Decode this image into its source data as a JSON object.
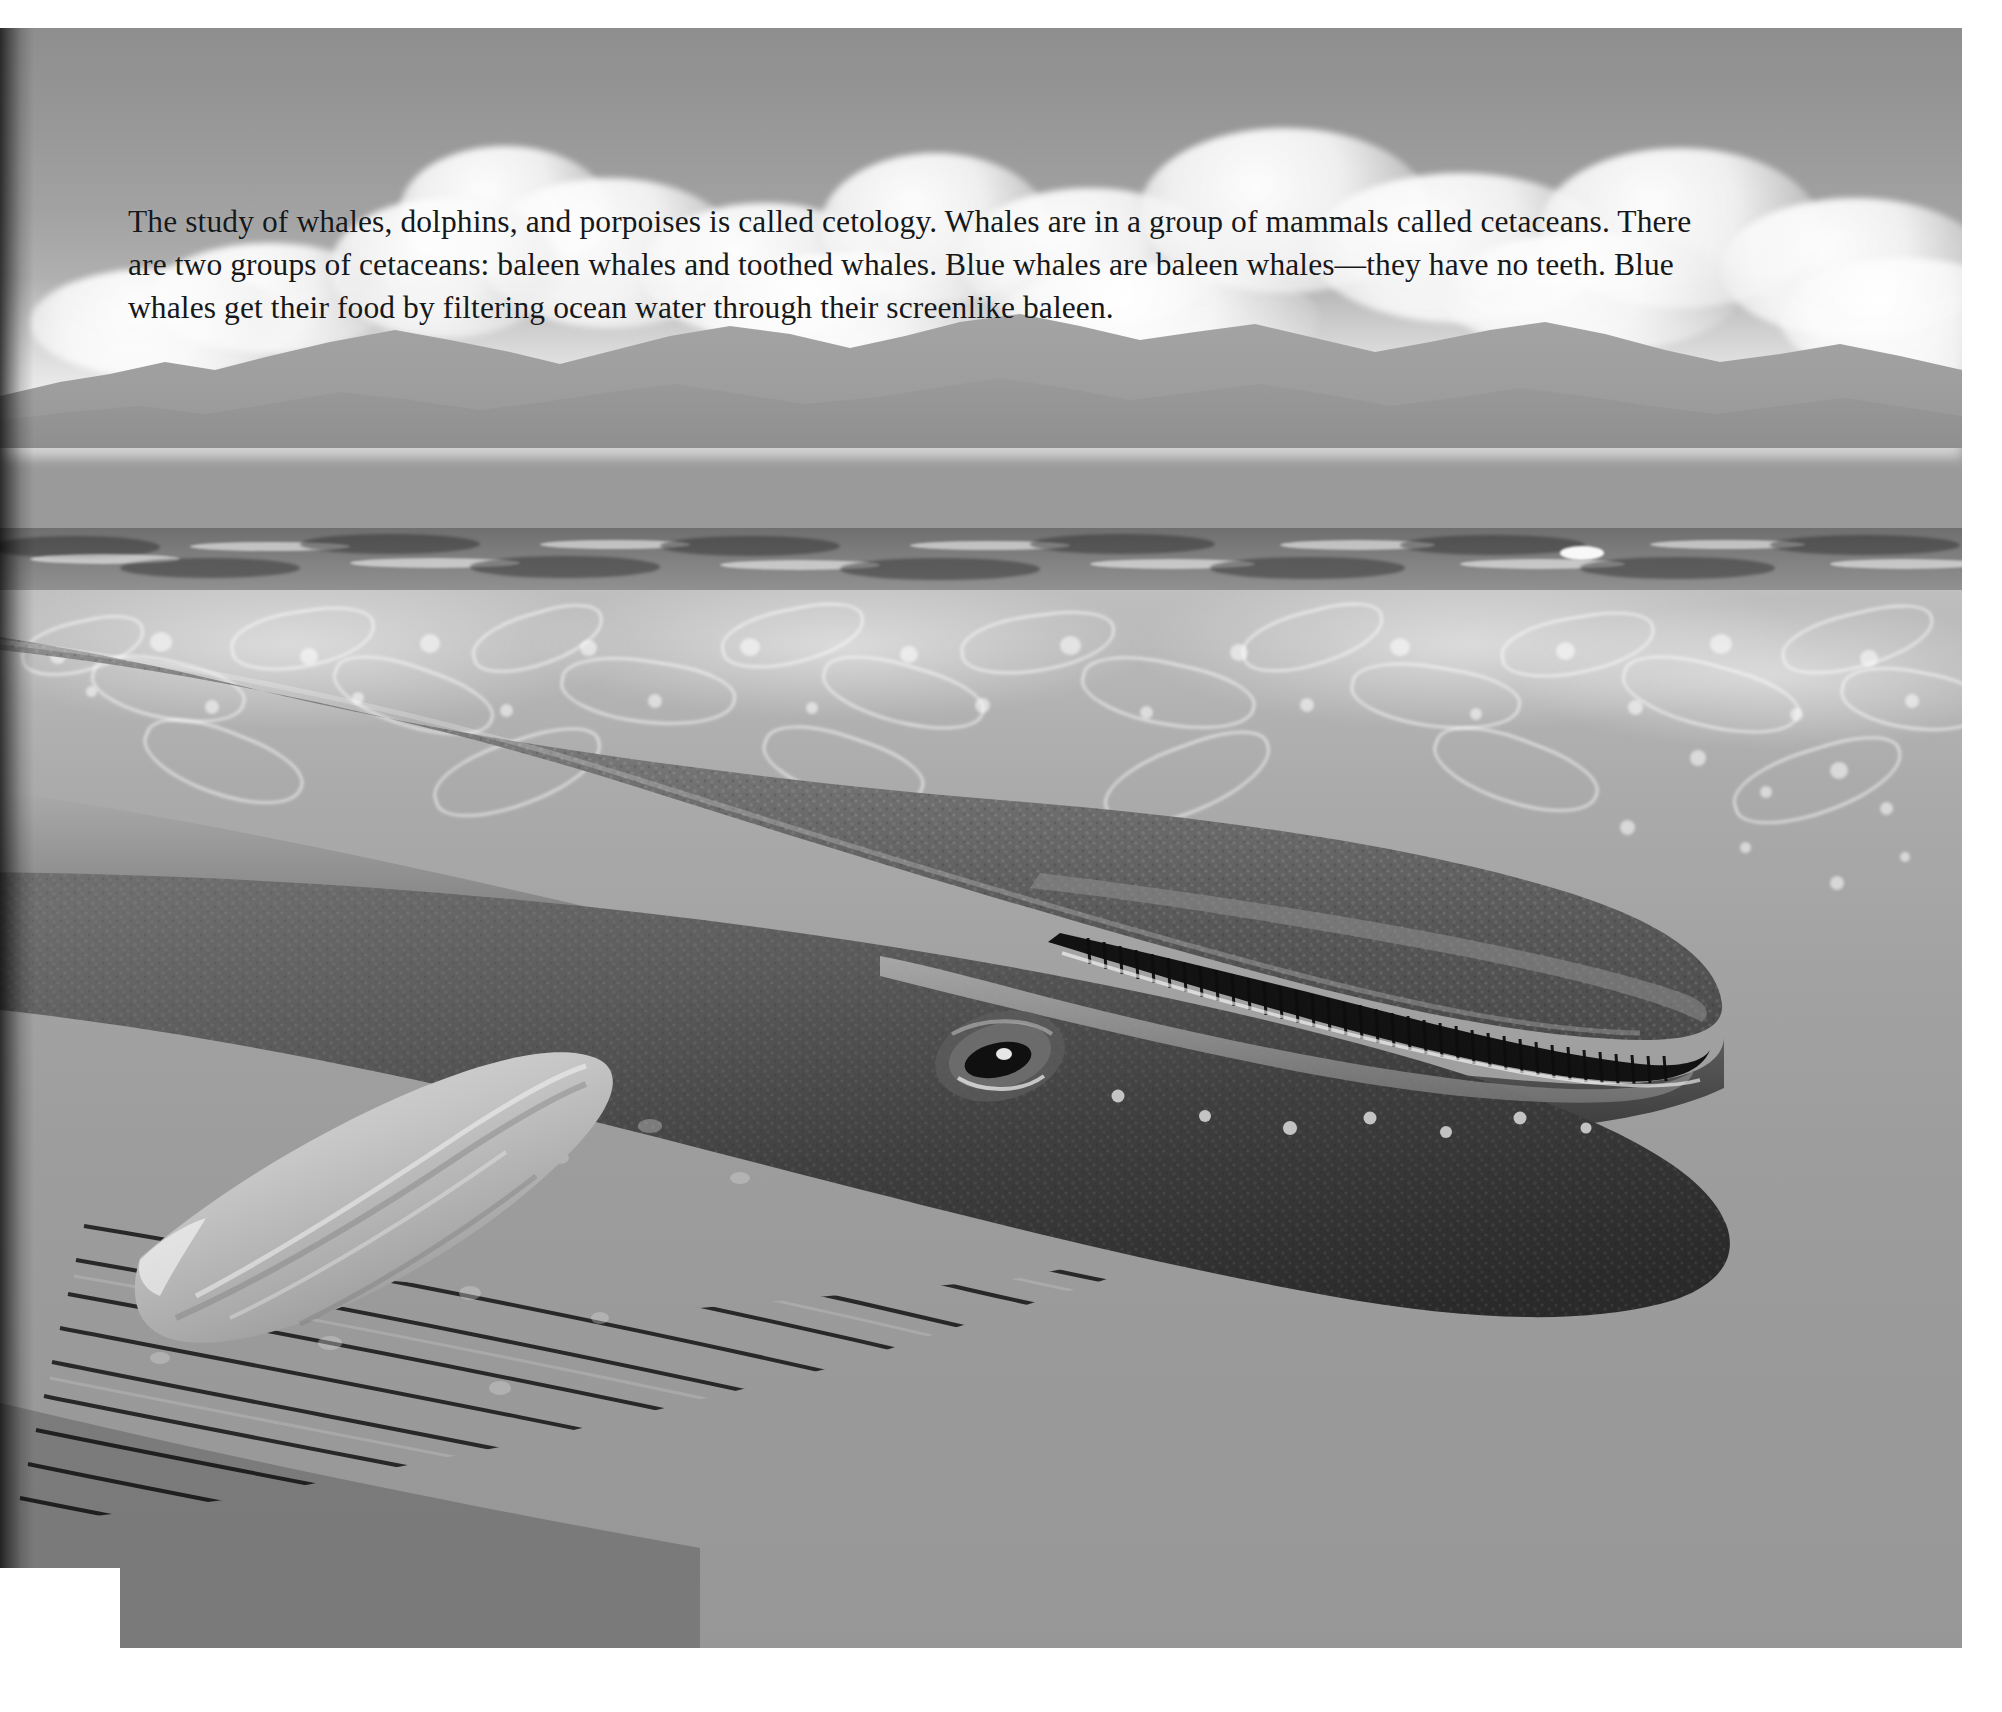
{
  "page": {
    "kind": "illustrated-book-page",
    "background_color": "#ffffff"
  },
  "caption": {
    "text": "The study of whales, dolphins, and porpoises is called cetology. Whales are in a group of mammals called cetaceans. There are two groups of cetaceans: baleen whales and toothed whales. Blue whales are baleen whales—they have no teeth. Blue whales get their food by filtering ocean water through their screenlike baleen.",
    "lines": [
      "The study of whales, dolphins, and porpoises is called cetology. Whales are in a group of mammals called",
      "cetaceans. There are two groups of cetaceans: baleen whales and toothed whales. Blue whales are baleen",
      "whales—they have no teeth. Blue whales get their food by filtering ocean water through their screenlike",
      "baleen."
    ],
    "text_color": "#16181a"
  },
  "illustration": {
    "title": "Blue whale swimming just below the ocean surface",
    "elements": [
      {
        "name": "sky",
        "label": "Sky",
        "color": "#a6a6a6"
      },
      {
        "name": "clouds",
        "label": "Cumulus clouds",
        "color": "#f4f4f4"
      },
      {
        "name": "mountains",
        "label": "Distant mountain range",
        "color": "#9b9b9b"
      },
      {
        "name": "ocean-surface",
        "label": "Choppy ocean surface",
        "color": "#7b7b7b"
      },
      {
        "name": "underwater",
        "label": "Underwater column",
        "color": "#aeaeae"
      },
      {
        "name": "light-caustics",
        "label": "Light caustics and bubbles",
        "color": "#ffffff"
      },
      {
        "name": "whale-body",
        "label": "Blue whale body",
        "color": "#4a4a4a"
      },
      {
        "name": "whale-eye",
        "label": "Whale eye",
        "color": "#141414"
      },
      {
        "name": "baleen-plates",
        "label": "Baleen plates",
        "color": "#1a1a1a"
      },
      {
        "name": "throat-pleats",
        "label": "Throat pleats (ventral grooves)",
        "color": "#2a2a2a"
      },
      {
        "name": "pectoral-flipper",
        "label": "Pectoral flipper",
        "color": "#c9c9c9"
      },
      {
        "name": "rostrum-knobs",
        "label": "Rostrum tubercles",
        "color": "#cfcfcf"
      }
    ],
    "palette": {
      "sky_top": "#8e8e8e",
      "sky_bottom": "#d4d4d4",
      "mountain": "#9b9b9b",
      "sea_band": "#7b7b7b",
      "water_top": "#bfbfbf",
      "water_bottom": "#979797",
      "whale_dark": "#3b3b3b",
      "whale_mid": "#6d6d6d",
      "whale_light": "#8c8c8c",
      "flipper": "#c9c9c9",
      "baleen": "#151515"
    }
  }
}
